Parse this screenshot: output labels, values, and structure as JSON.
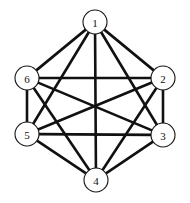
{
  "figure": {
    "background_color": "#ffffff",
    "width": 190,
    "height": 203
  },
  "chart_data": {
    "type": "diagram",
    "graph_type": "complete-graph",
    "node_count": 6,
    "edge_count": 15,
    "layout": "hexagonal",
    "edge_color": "#111111",
    "node_fill": "#ffffff",
    "node_stroke": "#151515",
    "nodes": [
      {
        "id": "1",
        "label": "1",
        "x": 95,
        "y": 22,
        "r": 12
      },
      {
        "id": "2",
        "label": "2",
        "x": 163,
        "y": 78,
        "r": 12
      },
      {
        "id": "3",
        "label": "3",
        "x": 163,
        "y": 135,
        "r": 12
      },
      {
        "id": "4",
        "label": "4",
        "x": 96,
        "y": 180,
        "r": 12
      },
      {
        "id": "5",
        "label": "5",
        "x": 27,
        "y": 134,
        "r": 12
      },
      {
        "id": "6",
        "label": "6",
        "x": 27,
        "y": 78,
        "r": 12
      }
    ],
    "edges": [
      {
        "from": "1",
        "to": "2"
      },
      {
        "from": "1",
        "to": "3"
      },
      {
        "from": "1",
        "to": "4"
      },
      {
        "from": "1",
        "to": "5"
      },
      {
        "from": "1",
        "to": "6"
      },
      {
        "from": "2",
        "to": "3"
      },
      {
        "from": "2",
        "to": "4"
      },
      {
        "from": "2",
        "to": "5"
      },
      {
        "from": "2",
        "to": "6"
      },
      {
        "from": "3",
        "to": "4"
      },
      {
        "from": "3",
        "to": "5"
      },
      {
        "from": "3",
        "to": "6"
      },
      {
        "from": "4",
        "to": "5"
      },
      {
        "from": "4",
        "to": "6"
      },
      {
        "from": "5",
        "to": "6"
      }
    ]
  }
}
